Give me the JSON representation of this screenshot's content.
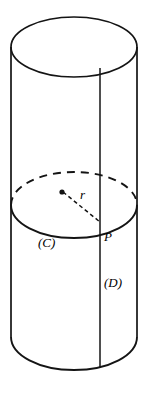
{
  "figure": {
    "shape": "cylinder",
    "stroke_color": "#141414",
    "background_color": "#ffffff",
    "canvas": {
      "width": 148,
      "height": 394
    },
    "geometry": {
      "axis_x": 74,
      "left_side_x": 11,
      "right_side_x": 137,
      "radius_x": 63,
      "top_ellipse": {
        "center_y": 47,
        "radius_y": 30
      },
      "mid_ellipse": {
        "center_y": 205,
        "radius_y": 33
      },
      "bottom_arc": {
        "center_y": 337,
        "radius_y": 33
      },
      "generator_line_x": 100,
      "center_dot": {
        "x": 62,
        "y": 192
      },
      "point_p": {
        "x": 100,
        "y": 222
      }
    },
    "labels": {
      "circle": "(C)",
      "point": "P",
      "disk": "(D)",
      "radius": "r"
    },
    "icons": {
      "center_dot": "center-point-dot",
      "radius_segment": "dashed-radius-segment",
      "hidden_arc": "dashed-hidden-arc"
    }
  }
}
